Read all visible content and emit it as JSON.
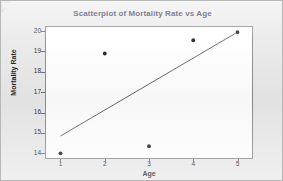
{
  "chart_data": {
    "type": "scatter",
    "title": "Scatterplot of Mortality Rate vs Age",
    "xlabel": "Age",
    "ylabel": "Mortality Rate",
    "x": [
      1,
      2,
      3,
      4,
      5
    ],
    "values": [
      14.0,
      18.9,
      14.35,
      19.55,
      19.95
    ],
    "series": [
      {
        "name": "Mortality Rate",
        "points": [
          {
            "x": 1,
            "y": 14.0
          },
          {
            "x": 2,
            "y": 18.9
          },
          {
            "x": 3,
            "y": 14.35
          },
          {
            "x": 4,
            "y": 19.55
          },
          {
            "x": 5,
            "y": 19.95
          }
        ]
      },
      {
        "name": "fit-line",
        "type": "line",
        "points": [
          {
            "x": 1,
            "y": 14.85
          },
          {
            "x": 5,
            "y": 19.95
          }
        ]
      }
    ],
    "xlim": [
      0.65,
      5.35
    ],
    "ylim": [
      13.72,
      20.25
    ],
    "xticks": [
      "1",
      "2",
      "3",
      "4",
      "5"
    ],
    "xtick_values": [
      1,
      2,
      3,
      4,
      5
    ],
    "yticks": [
      "14",
      "15",
      "16",
      "17",
      "18",
      "19",
      "20"
    ],
    "ytick_values": [
      14,
      15,
      16,
      17,
      18,
      19,
      20
    ],
    "grid": false,
    "legend": false,
    "marker_color": "#1a1a1a",
    "line_color": "#555555",
    "title_color": "#1f2a44",
    "plot_background": "#ffffff",
    "figure_background": "#e9e9e9"
  }
}
